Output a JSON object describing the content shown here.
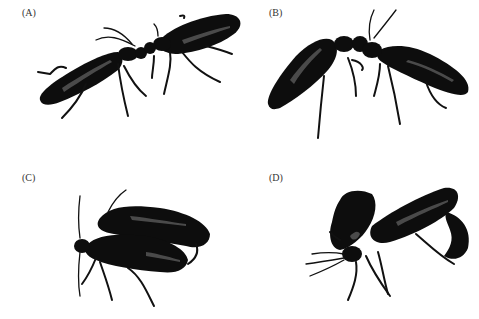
{
  "figure": {
    "panels": [
      {
        "id": "A",
        "label": "(A)",
        "subject": "two beetles facing each other, head-to-head, bodies extended in a line"
      },
      {
        "id": "B",
        "label": "(B)",
        "subject": "two beetles head-to-head with bodies raised in an inverted V"
      },
      {
        "id": "C",
        "label": "(C)",
        "subject": "one beetle mounted on top of another, side by side"
      },
      {
        "id": "D",
        "label": "(D)",
        "subject": "two beetles in mating position with curled abdomen"
      }
    ],
    "colors": {
      "beetle": "#0d0d0d",
      "background": "#ffffff",
      "label": "#333333"
    }
  }
}
